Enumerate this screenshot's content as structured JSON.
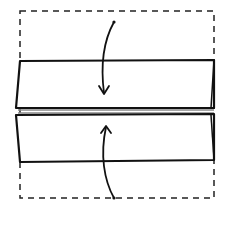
{
  "diagram": {
    "colors": {
      "background": "#ffffff",
      "stroke": "#111111",
      "crease": "#777777"
    },
    "elements": {
      "outline": {
        "label": "original paper outline",
        "style": "dashed"
      },
      "top_flap": {
        "label": "top flap folded down"
      },
      "bottom_flap": {
        "label": "bottom flap folded up"
      },
      "center_line": {
        "label": "center crease"
      },
      "arrows": [
        {
          "label": "fold-down arrow",
          "direction": "down"
        },
        {
          "label": "fold-up arrow",
          "direction": "up"
        }
      ]
    }
  }
}
